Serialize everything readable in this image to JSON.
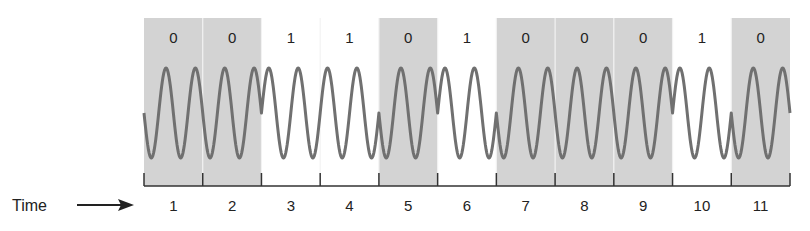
{
  "diagram": {
    "axis_label": "Time",
    "colors": {
      "shade": "#d3d3d3",
      "wave": "#707070",
      "axis": "#333333",
      "divider": "#f2f2f2"
    },
    "segments": [
      {
        "time": "1",
        "bit": "0"
      },
      {
        "time": "2",
        "bit": "0"
      },
      {
        "time": "3",
        "bit": "1"
      },
      {
        "time": "4",
        "bit": "1"
      },
      {
        "time": "5",
        "bit": "0"
      },
      {
        "time": "6",
        "bit": "1"
      },
      {
        "time": "7",
        "bit": "0"
      },
      {
        "time": "8",
        "bit": "0"
      },
      {
        "time": "9",
        "bit": "0"
      },
      {
        "time": "10",
        "bit": "1"
      },
      {
        "time": "11",
        "bit": "0"
      }
    ],
    "cycles_per_bit": 2
  }
}
